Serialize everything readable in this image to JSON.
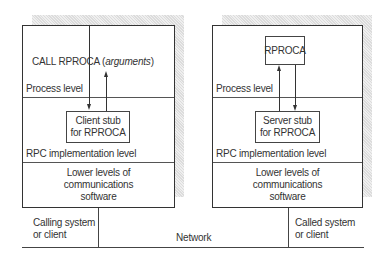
{
  "client": {
    "call_text": "CALL RPROCA (",
    "call_args": "arguments",
    "call_close": ")",
    "process_level": "Process level",
    "stub_line1": "Client stub",
    "stub_line2": "for RPROCA",
    "rpc_level": "RPC implementation level",
    "lower_line1": "Lower levels of",
    "lower_line2": "communications",
    "lower_line3": "software",
    "system_line1": "Calling system",
    "system_line2": "or client"
  },
  "server": {
    "procedure": "RPROCA",
    "process_level": "Process level",
    "stub_line1": "Server stub",
    "stub_line2": "for RPROCA",
    "rpc_level": "RPC implementation level",
    "lower_line1": "Lower levels of",
    "lower_line2": "communications",
    "lower_line3": "software",
    "system_line1": "Called system",
    "system_line2": "or client"
  },
  "network": {
    "label": "Network"
  },
  "colors": {
    "line": "#333333",
    "shadow": "#e6e6e6",
    "text": "#333333"
  }
}
